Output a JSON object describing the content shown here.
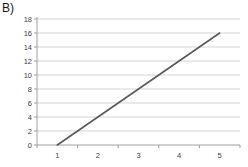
{
  "panel_label": "B)",
  "chart_data": {
    "type": "line",
    "title": "",
    "xlabel": "",
    "ylabel": "",
    "categories": [
      "1",
      "2",
      "3",
      "4",
      "5"
    ],
    "series": [
      {
        "name": "series-1",
        "values": [
          0,
          4,
          8,
          12,
          16
        ],
        "color": "#595959"
      }
    ],
    "ylim": [
      0,
      18
    ],
    "y_tick_step": 2,
    "y_ticks": [
      0,
      2,
      4,
      6,
      8,
      10,
      12,
      14,
      16,
      18
    ],
    "grid": "horizontal",
    "legend": "none",
    "colors": {
      "grid": "#d4d4d4",
      "axis": "#a0a0a0",
      "tick_text": "#3f3f3f",
      "background": "#ffffff"
    }
  }
}
